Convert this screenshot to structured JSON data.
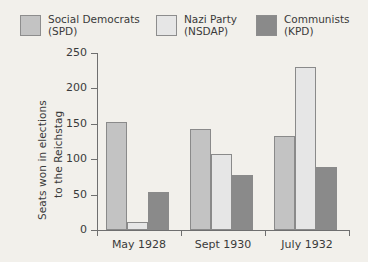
{
  "legend": {
    "items": [
      {
        "name": "Social Democrats",
        "abbr": "(SPD)",
        "color": "#c3c3c3"
      },
      {
        "name": "Nazi Party",
        "abbr": "(NSDAP)",
        "color": "#e6e6e6"
      },
      {
        "name": "Communists",
        "abbr": "(KPD)",
        "color": "#8a8a8a"
      }
    ]
  },
  "axis": {
    "y_title_line1": "Seats won in elections",
    "y_title_line2": "to the Reichstag",
    "y_ticks": [
      "0",
      "50",
      "100",
      "150",
      "200",
      "250"
    ]
  },
  "chart_data": {
    "type": "bar",
    "title": "",
    "xlabel": "",
    "ylabel": "Seats won in elections to the Reichstag",
    "ylim": [
      0,
      250
    ],
    "ytick_values": [
      0,
      50,
      100,
      150,
      200,
      250
    ],
    "grid": false,
    "legend_position": "top",
    "categories": [
      "May 1928",
      "Sept 1930",
      "July 1932"
    ],
    "series": [
      {
        "name": "Social Democrats (SPD)",
        "color": "#c3c3c3",
        "values": [
          153,
          143,
          133
        ]
      },
      {
        "name": "Nazi Party (NSDAP)",
        "color": "#e6e6e6",
        "values": [
          12,
          107,
          230
        ]
      },
      {
        "name": "Communists (KPD)",
        "color": "#8a8a8a",
        "values": [
          54,
          77,
          89
        ]
      }
    ]
  }
}
